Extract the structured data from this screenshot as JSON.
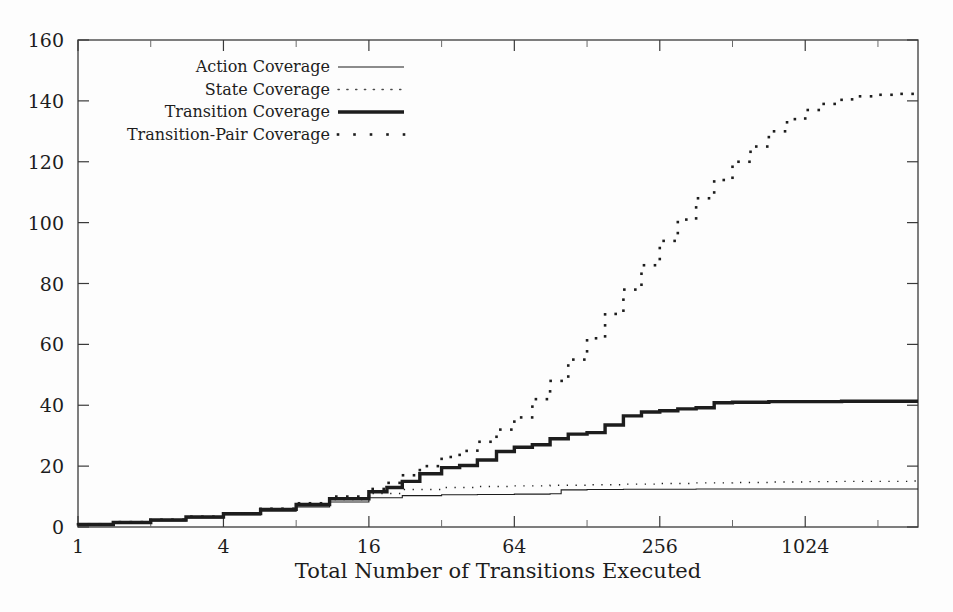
{
  "chart_data": {
    "type": "line",
    "title": "",
    "xlabel": "Total Number of Transitions Executed",
    "ylabel": "",
    "xscale": "log2",
    "xlim": [
      1,
      3000
    ],
    "ylim": [
      0,
      160
    ],
    "grid": false,
    "legend_position": "top-left-inside",
    "xticks": [
      1,
      4,
      16,
      64,
      256,
      1024
    ],
    "xtick_labels": [
      "1",
      "4",
      "16",
      "64",
      "256",
      "1024"
    ],
    "yticks": [
      0,
      20,
      40,
      60,
      80,
      100,
      120,
      140,
      160
    ],
    "ytick_labels": [
      "0",
      "20",
      "40",
      "60",
      "80",
      "100",
      "120",
      "140",
      "160"
    ],
    "series": [
      {
        "name": "Action Coverage",
        "style": "thin-solid",
        "x": [
          1,
          1.4,
          2,
          2.8,
          4,
          5.7,
          8,
          11,
          16,
          22,
          32,
          45,
          64,
          90,
          100,
          128,
          181,
          256,
          362,
          512,
          724,
          1024,
          1448,
          2048,
          2896
        ],
        "values": [
          0.6,
          1.2,
          2.0,
          3.0,
          4.0,
          5.2,
          6.6,
          8.2,
          9.6,
          10.3,
          10.6,
          10.7,
          10.8,
          10.9,
          12.2,
          12.3,
          12.4,
          12.4,
          12.5,
          12.5,
          12.5,
          12.5,
          12.5,
          12.5,
          12.5
        ]
      },
      {
        "name": "State Coverage",
        "style": "fine-dotted",
        "x": [
          1,
          1.4,
          2,
          2.8,
          4,
          5.7,
          8,
          11,
          16,
          22,
          32,
          45,
          64,
          90,
          128,
          181,
          256,
          362,
          512,
          724,
          1024,
          1448,
          2048,
          2896
        ],
        "values": [
          0.8,
          1.4,
          2.2,
          3.2,
          4.3,
          5.6,
          7.2,
          9.0,
          11.0,
          12.3,
          13.0,
          13.3,
          13.5,
          13.7,
          13.9,
          14.1,
          14.3,
          14.5,
          14.6,
          14.8,
          14.9,
          15.0,
          15.0,
          15.1
        ]
      },
      {
        "name": "Transition Coverage",
        "style": "thick-solid",
        "x": [
          1,
          1.4,
          2,
          2.8,
          4,
          5.7,
          8,
          11,
          16,
          19,
          22,
          26,
          32,
          38,
          45,
          54,
          64,
          76,
          90,
          107,
          128,
          152,
          181,
          215,
          256,
          304,
          362,
          430,
          512,
          724,
          1024,
          1448,
          2048,
          2896
        ],
        "values": [
          0.8,
          1.5,
          2.3,
          3.3,
          4.4,
          5.8,
          7.4,
          9.3,
          11.6,
          13.0,
          15.0,
          17.5,
          19.5,
          20.2,
          22.0,
          24.8,
          26.2,
          27.0,
          29.0,
          30.5,
          31.0,
          33.5,
          36.5,
          37.8,
          38.2,
          38.8,
          39.2,
          40.8,
          41.0,
          41.2,
          41.2,
          41.3,
          41.3,
          41.3
        ]
      },
      {
        "name": "Transition-Pair Coverage",
        "style": "bold-dotted",
        "x": [
          1,
          1.4,
          2,
          2.8,
          4,
          5.7,
          8,
          11,
          16,
          19,
          22,
          26,
          32,
          38,
          45,
          54,
          64,
          76,
          90,
          107,
          128,
          152,
          181,
          215,
          256,
          304,
          362,
          430,
          512,
          608,
          724,
          861,
          1024,
          1217,
          1448,
          1722,
          2048,
          2435,
          2896
        ],
        "values": [
          0.9,
          1.6,
          2.4,
          3.4,
          4.5,
          6.0,
          7.8,
          10.0,
          12.5,
          14.5,
          17.0,
          20.0,
          23.0,
          25.0,
          28.0,
          32.0,
          36.0,
          42.0,
          48.0,
          55.0,
          62.0,
          70.0,
          78.0,
          86.0,
          94.0,
          101.0,
          108.0,
          114.0,
          120.0,
          125.0,
          130.0,
          134.0,
          137.0,
          139.0,
          140.5,
          141.5,
          142.0,
          142.3,
          142.5
        ]
      }
    ]
  },
  "legend": {
    "entries": [
      {
        "label": "Action Coverage",
        "style": "thin-solid"
      },
      {
        "label": "State Coverage",
        "style": "fine-dotted"
      },
      {
        "label": "Transition Coverage",
        "style": "thick-solid"
      },
      {
        "label": "Transition-Pair Coverage",
        "style": "bold-dotted"
      }
    ]
  },
  "colors": {
    "ink": "#1d1d1d",
    "axis": "#3a3a3a",
    "background": "#fdfdfd",
    "state_series": "#4a4a4a"
  }
}
